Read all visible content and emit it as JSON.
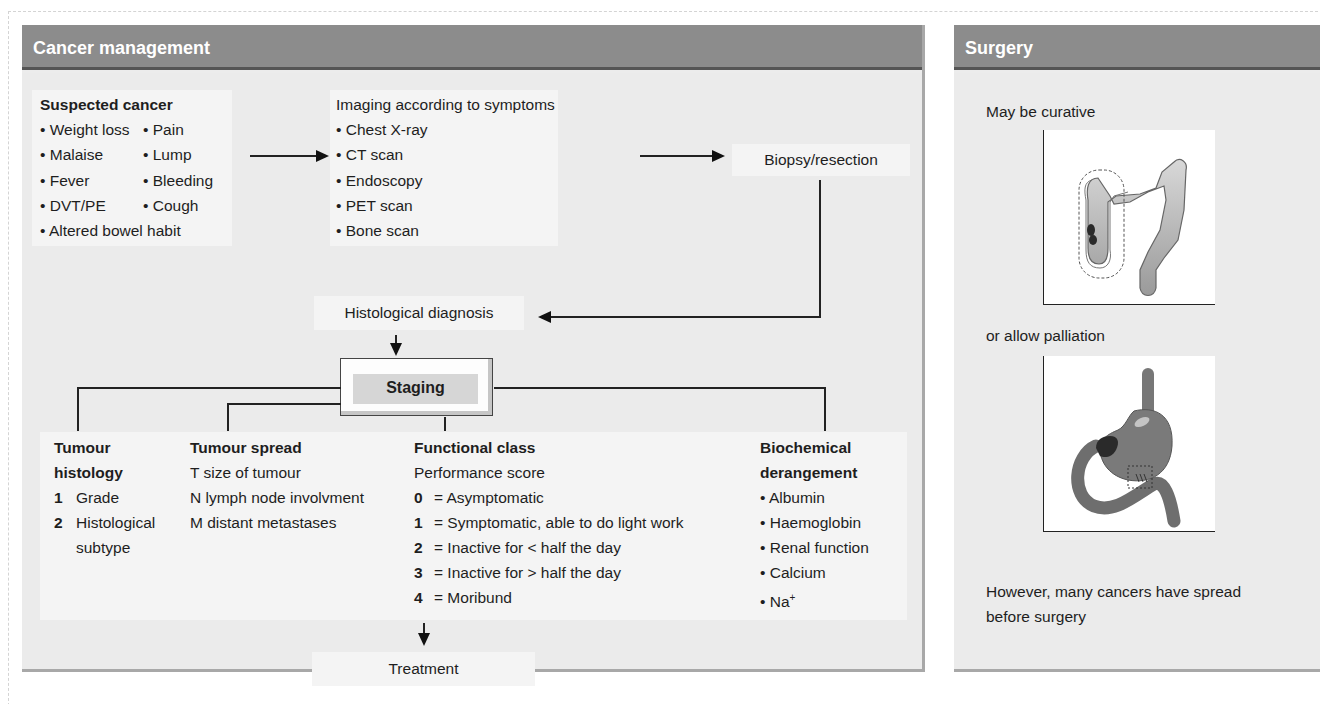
{
  "cancer_management": {
    "title": "Cancer management",
    "suspected": {
      "heading": "Suspected cancer",
      "col1": [
        "Weight loss",
        "Malaise",
        "Fever",
        "DVT/PE"
      ],
      "col2": [
        "Pain",
        "Lump",
        "Bleeding",
        "Cough"
      ],
      "last": "Altered bowel habit"
    },
    "imaging": {
      "heading": "Imaging according to symptoms",
      "items": [
        "Chest X-ray",
        "CT scan",
        "Endoscopy",
        "PET scan",
        "Bone scan"
      ]
    },
    "biopsy": "Biopsy/resection",
    "histological_diagnosis": "Histological diagnosis",
    "staging": "Staging",
    "tumour_histology": {
      "heading_1": "Tumour",
      "heading_2": "histology",
      "items": [
        {
          "num": "1",
          "text": "Grade"
        },
        {
          "num": "2",
          "text": "Histological",
          "text2": "subtype"
        }
      ]
    },
    "tumour_spread": {
      "heading": "Tumour spread",
      "items": [
        "T size of tumour",
        "N lymph node involvment",
        "M distant metastases"
      ]
    },
    "functional_class": {
      "heading": "Functional class",
      "subheading": "Performance score",
      "items": [
        {
          "num": "0",
          "text": "= Asymptomatic"
        },
        {
          "num": "1",
          "text": "= Symptomatic, able to do light work"
        },
        {
          "num": "2",
          "text": "= Inactive for < half the day"
        },
        {
          "num": "3",
          "text": "= Inactive for > half the day"
        },
        {
          "num": "4",
          "text": "= Moribund"
        }
      ]
    },
    "biochemical": {
      "heading_1": "Biochemical",
      "heading_2": "derangement",
      "items": [
        "Albumin",
        "Haemoglobin",
        "Renal function",
        "Calcium",
        "Na+"
      ]
    },
    "treatment": "Treatment"
  },
  "surgery": {
    "title": "Surgery",
    "curative": "May be curative",
    "palliation": "or allow palliation",
    "note_1": "However, many cancers have spread",
    "note_2": "before surgery",
    "illustrations": [
      "colon-resection-illustration",
      "stomach-bypass-illustration"
    ]
  },
  "colors": {
    "header_bg": "#8c8c8c",
    "panel_bg": "#ebebeb",
    "box_bg": "#f4f4f4",
    "tumour_dark": "#2a2a2a"
  }
}
